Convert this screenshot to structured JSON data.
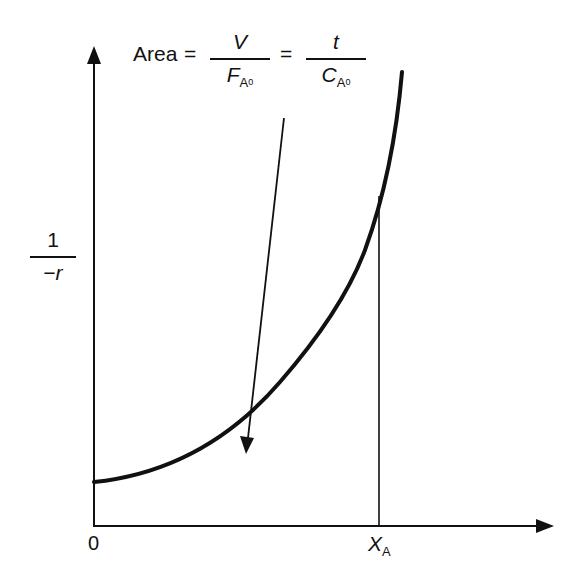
{
  "equation": {
    "lhs": "Area",
    "eq1": "=",
    "frac1": {
      "num": "V",
      "den_main": "F",
      "den_sub": "A",
      "den_subsub": "0"
    },
    "eq2": "=",
    "frac2": {
      "num": "t",
      "den_main": "C",
      "den_sub": "A",
      "den_subsub": "0"
    }
  },
  "y_axis": {
    "label_num": "1",
    "label_den": "−r"
  },
  "x_axis": {
    "origin": "0",
    "mark_main": "X",
    "mark_sub": "A"
  },
  "colors": {
    "ink": "#111111",
    "background": "#ffffff"
  }
}
